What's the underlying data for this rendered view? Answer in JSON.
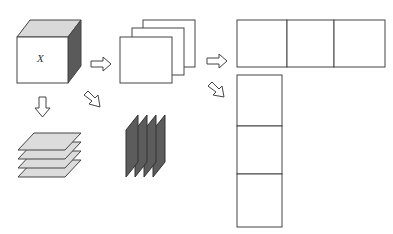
{
  "diagram": {
    "cube": {
      "label": "X",
      "front_color": "#ffffff",
      "top_color": "#d9d9d9",
      "side_color": "#5a5a5a"
    },
    "colors": {
      "stroke": "#444444",
      "plate_fill": "#dcdcdc",
      "slice_fill": "#5c5c5c",
      "sheet_fill": "#ffffff"
    },
    "arrows": [
      {
        "id": "cube-to-sheets",
        "direction": "right"
      },
      {
        "id": "cube-to-plates",
        "direction": "down"
      },
      {
        "id": "cube-to-slices",
        "direction": "down-right"
      },
      {
        "id": "sheets-to-horizontal-strip",
        "direction": "right"
      },
      {
        "id": "sheets-to-vertical-strip",
        "direction": "down-right"
      }
    ],
    "stacked_sheets_count": 3,
    "horizontal_plates_count": 4,
    "vertical_slices_count": 4,
    "horizontal_strip_cells": 3,
    "vertical_strip_cells": 3
  }
}
